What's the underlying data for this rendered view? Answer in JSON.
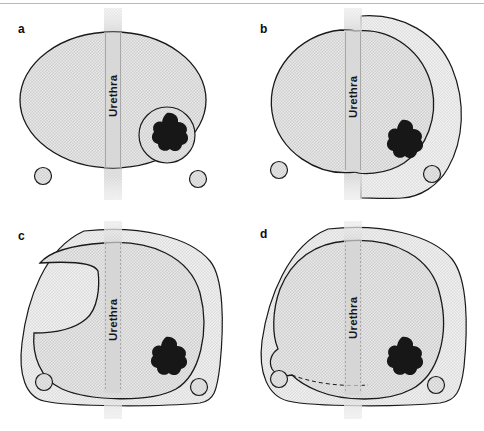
{
  "figure": {
    "panels": [
      {
        "id": "a",
        "label": "a",
        "urethra_label": "Urethra",
        "description": "Prostate with tumour and surrounding margin circle; no extended resection",
        "structures": [
          "prostate-capsule",
          "urethra-band",
          "tumour-nodule",
          "tumour-margin-circle",
          "left-neurovascular-bundle",
          "right-neurovascular-bundle"
        ]
      },
      {
        "id": "b",
        "label": "b",
        "urethra_label": "Urethra",
        "description": "Unilateral wide resection of right lobe including right neurovascular bundle",
        "structures": [
          "prostate-capsule",
          "urethra-band",
          "tumour-nodule",
          "resection-zone",
          "left-neurovascular-bundle",
          "right-neurovascular-bundle"
        ]
      },
      {
        "id": "c",
        "label": "c",
        "urethra_label": "Urethra",
        "description": "Wider resection extending across midline with anterior notch",
        "structures": [
          "prostate-capsule",
          "urethra-band",
          "tumour-nodule",
          "resection-zone",
          "left-neurovascular-bundle",
          "right-neurovascular-bundle"
        ]
      },
      {
        "id": "d",
        "label": "d",
        "urethra_label": "Urethra",
        "description": "Bilateral wide resection including both neurovascular bundles",
        "structures": [
          "prostate-capsule",
          "urethra-band",
          "tumour-nodule",
          "resection-zone",
          "left-neurovascular-bundle",
          "right-neurovascular-bundle"
        ]
      }
    ],
    "legend_keys": {
      "urethra": "Urethra",
      "tumour": "tumour nodule",
      "neurovascular_bundle": "neurovascular bundle"
    },
    "colors": {
      "prostate_fill": "#c9c9c9",
      "resection_fill": "#d8d8d8",
      "urethra_fill": "#d2d2d2",
      "tumour_fill": "#1b1b1b",
      "outline": "#1a1a1a",
      "background": "#ffffff",
      "rule": "#b9b9b9"
    }
  }
}
